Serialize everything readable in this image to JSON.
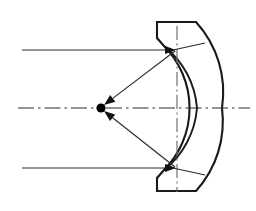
{
  "figure": {
    "width": 256,
    "height": 211,
    "background_color": "#ffffff",
    "line_color": "#2b2b2b",
    "outline_color": "#1a1a1a",
    "focus_color": "#000000"
  },
  "optical_axis": {
    "name": "optical-axis",
    "style": "dash-dot",
    "y": 108,
    "x_start": 18,
    "x_end": 250
  },
  "mirror_axis": {
    "name": "mirror-vertical-axis",
    "style": "dash-dot",
    "x": 177,
    "y_start": 26,
    "y_end": 192
  },
  "mirror": {
    "name": "concave-mirror",
    "type": "spherical-concave",
    "reflective_surface": "left-inner-arc",
    "inner_arc": {
      "vertex_x": 197,
      "vertex_y": 108,
      "top_x": 173,
      "top_y": 50,
      "bottom_x": 173,
      "bottom_y": 168
    },
    "outer_arc": {
      "vertex_x": 222,
      "vertex_y": 108
    },
    "notch_top": true,
    "notch_bottom": true
  },
  "focal_point": {
    "name": "focal-point",
    "x": 101,
    "y": 108,
    "radius": 4.6,
    "label": ""
  },
  "incident_rays": [
    {
      "name": "incident-ray-top",
      "x_start": 22,
      "x_end": 175,
      "y": 50,
      "direction": "right",
      "arrow": true
    },
    {
      "name": "incident-ray-axis",
      "x_start": 18,
      "x_end": 250,
      "y": 108,
      "direction": "right",
      "arrow": false
    },
    {
      "name": "incident-ray-bottom",
      "x_start": 22,
      "x_end": 175,
      "y": 168,
      "direction": "right",
      "arrow": true
    }
  ],
  "reflected_rays": [
    {
      "name": "reflected-ray-top",
      "from_x": 175,
      "from_y": 51,
      "to_x": 104,
      "to_y": 105,
      "arrow": true,
      "arrow_at": "focus"
    },
    {
      "name": "reflected-ray-bottom",
      "from_x": 175,
      "from_y": 167,
      "to_x": 104,
      "to_y": 111,
      "arrow": true,
      "arrow_at": "focus"
    }
  ],
  "chord_lines": [
    {
      "name": "chord-top",
      "from_x": 173,
      "from_y": 50,
      "to_x": 205,
      "to_y": 43
    },
    {
      "name": "chord-bottom",
      "from_x": 173,
      "from_y": 168,
      "to_x": 205,
      "to_y": 175
    }
  ]
}
